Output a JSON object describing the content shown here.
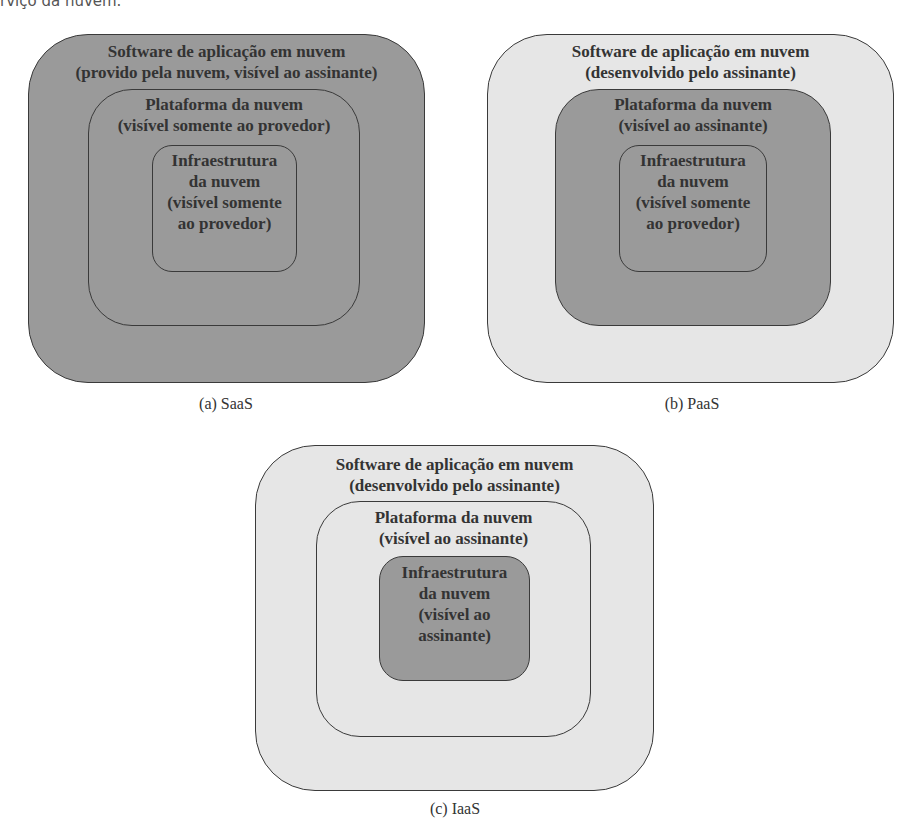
{
  "page": {
    "top_fragment": "rviço da nuvem."
  },
  "diagrams": [
    {
      "caption": "(a) SaaS",
      "outer": {
        "line1": "Software de aplicação em nuvem",
        "line2": "(provido pela nuvem, visível ao assinante)",
        "shade": "dark"
      },
      "middle": {
        "line1": "Plataforma da nuvem",
        "line2": "(visível somente ao provedor)",
        "shade": "dark"
      },
      "inner": {
        "line1": "Infraestrutura",
        "line2": "da nuvem",
        "line3": "(visível somente",
        "line4": "ao provedor)",
        "shade": "dark"
      }
    },
    {
      "caption": "(b) PaaS",
      "outer": {
        "line1": "Software de aplicação em nuvem",
        "line2": "(desenvolvido pelo assinante)",
        "shade": "light"
      },
      "middle": {
        "line1": "Plataforma da nuvem",
        "line2": "(visível ao assinante)",
        "shade": "dark"
      },
      "inner": {
        "line1": "Infraestrutura",
        "line2": "da nuvem",
        "line3": "(visível somente",
        "line4": "ao provedor)",
        "shade": "dark"
      }
    },
    {
      "caption": "(c) IaaS",
      "outer": {
        "line1": "Software de aplicação em nuvem",
        "line2": "(desenvolvido pelo assinante)",
        "shade": "light"
      },
      "middle": {
        "line1": "Plataforma da nuvem",
        "line2": "(visível ao assinante)",
        "shade": "light"
      },
      "inner": {
        "line1": "Infraestrutura",
        "line2": "da nuvem",
        "line3": "(visível ao",
        "line4": "assinante)",
        "shade": "dark"
      }
    }
  ],
  "colors": {
    "dark_fill": "#9a9a9a",
    "light_fill": "#e6e6e6",
    "border": "#3a3a3a"
  }
}
